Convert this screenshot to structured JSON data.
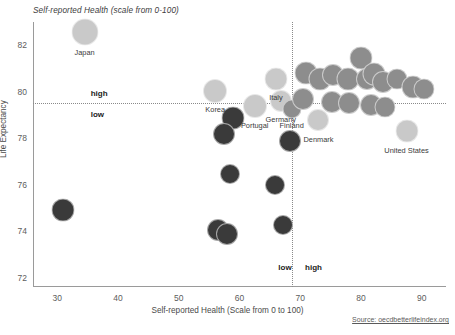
{
  "chart_data": {
    "type": "scatter",
    "title": "Self-reported Health (scale from 0-100)",
    "xlabel": "Self-reported Health (Scale from 0 to 100)",
    "ylabel": "Life Expectancy",
    "source": "Source: oecdbetterlifeindex.org",
    "xlim": [
      26,
      94
    ],
    "ylim": [
      71.6,
      83.0
    ],
    "xticks": [
      30,
      40,
      50,
      60,
      70,
      80,
      90
    ],
    "yticks": [
      82,
      80,
      78,
      76,
      74,
      72
    ],
    "grid": false,
    "legend": "none",
    "quadrant_lines": {
      "x": 68.6,
      "y": 79.5
    },
    "quadrant_labels": [
      {
        "text": "high",
        "x": 35.5,
        "y": 79.95,
        "position": "above-left"
      },
      {
        "text": "low",
        "x": 35.5,
        "y": 79.05,
        "position": "below-left"
      },
      {
        "text": "low",
        "x": 66.4,
        "y": 72.45,
        "position": "left-of-vline"
      },
      {
        "text": "high",
        "x": 70.8,
        "y": 72.45,
        "position": "right-of-vline"
      }
    ],
    "colors": {
      "light": "#c9c9c9",
      "medium": "#8d8d8d",
      "dark": "#3a3a3a",
      "axis": "#9a9a9a",
      "text": "#4a4a4a"
    },
    "points": [
      {
        "label": "Japan",
        "x": 34.5,
        "y": 82.55,
        "r": 13.5,
        "tone": "light",
        "label_dy": 16
      },
      {
        "label": "Korea",
        "x": 56.0,
        "y": 80.05,
        "r": 12.0,
        "tone": "light",
        "label_dy": 14
      },
      {
        "label": "Portugal",
        "x": 62.5,
        "y": 79.4,
        "r": 12.0,
        "tone": "light",
        "label_dy": 15
      },
      {
        "label": "Italy",
        "x": 66.0,
        "y": 80.55,
        "r": 11.5,
        "tone": "light",
        "label_dy": 14
      },
      {
        "label": "Germany",
        "x": 66.8,
        "y": 79.6,
        "r": 11.0,
        "tone": "light",
        "label_dy": 14
      },
      {
        "label": "Finland",
        "x": 68.6,
        "y": 79.25,
        "r": 9.5,
        "tone": "medium",
        "label_dy": 12
      },
      {
        "label": "Denmark",
        "x": 73.0,
        "y": 78.8,
        "r": 11.0,
        "tone": "light",
        "label_dy": 15
      },
      {
        "label": "United States",
        "x": 87.5,
        "y": 78.3,
        "r": 11.5,
        "tone": "light",
        "label_dy": 15
      },
      {
        "label": "",
        "x": 71.0,
        "y": 80.8,
        "r": 11.5,
        "tone": "medium"
      },
      {
        "label": "",
        "x": 73.2,
        "y": 80.55,
        "r": 11.5,
        "tone": "medium"
      },
      {
        "label": "",
        "x": 75.4,
        "y": 80.7,
        "r": 11.0,
        "tone": "medium"
      },
      {
        "label": "",
        "x": 77.8,
        "y": 80.55,
        "r": 11.5,
        "tone": "medium"
      },
      {
        "label": "",
        "x": 80.0,
        "y": 81.45,
        "r": 11.5,
        "tone": "medium"
      },
      {
        "label": "",
        "x": 81.0,
        "y": 80.55,
        "r": 11.0,
        "tone": "medium"
      },
      {
        "label": "",
        "x": 82.2,
        "y": 80.75,
        "r": 11.5,
        "tone": "medium"
      },
      {
        "label": "",
        "x": 83.6,
        "y": 80.4,
        "r": 11.0,
        "tone": "medium"
      },
      {
        "label": "",
        "x": 86.0,
        "y": 80.55,
        "r": 10.5,
        "tone": "medium"
      },
      {
        "label": "",
        "x": 88.6,
        "y": 80.2,
        "r": 11.5,
        "tone": "medium"
      },
      {
        "label": "",
        "x": 90.4,
        "y": 80.1,
        "r": 10.5,
        "tone": "medium"
      },
      {
        "label": "",
        "x": 70.4,
        "y": 79.7,
        "r": 11.0,
        "tone": "medium"
      },
      {
        "label": "",
        "x": 75.2,
        "y": 79.55,
        "r": 11.0,
        "tone": "medium"
      },
      {
        "label": "",
        "x": 78.0,
        "y": 79.5,
        "r": 11.0,
        "tone": "medium"
      },
      {
        "label": "",
        "x": 81.6,
        "y": 79.45,
        "r": 11.0,
        "tone": "medium"
      },
      {
        "label": "",
        "x": 84.0,
        "y": 79.35,
        "r": 10.5,
        "tone": "medium"
      },
      {
        "label": "",
        "x": 59.0,
        "y": 78.85,
        "r": 11.5,
        "tone": "dark"
      },
      {
        "label": "",
        "x": 57.4,
        "y": 78.2,
        "r": 11.0,
        "tone": "dark"
      },
      {
        "label": "",
        "x": 68.3,
        "y": 77.9,
        "r": 11.0,
        "tone": "dark"
      },
      {
        "label": "",
        "x": 58.4,
        "y": 76.45,
        "r": 10.0,
        "tone": "dark"
      },
      {
        "label": "",
        "x": 65.8,
        "y": 76.0,
        "r": 10.0,
        "tone": "dark"
      },
      {
        "label": "",
        "x": 31.0,
        "y": 74.9,
        "r": 11.5,
        "tone": "dark"
      },
      {
        "label": "",
        "x": 56.4,
        "y": 74.05,
        "r": 11.0,
        "tone": "dark"
      },
      {
        "label": "",
        "x": 58.0,
        "y": 73.9,
        "r": 11.0,
        "tone": "dark"
      },
      {
        "label": "",
        "x": 67.2,
        "y": 74.25,
        "r": 10.0,
        "tone": "dark"
      }
    ]
  }
}
